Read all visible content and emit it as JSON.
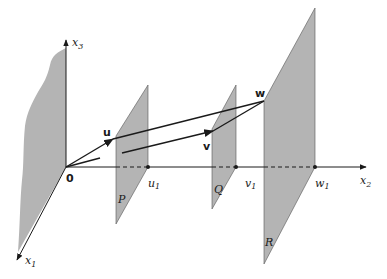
{
  "figure": {
    "axes": {
      "x1": {
        "label": "x",
        "sub": "1"
      },
      "x2": {
        "label": "x",
        "sub": "2"
      },
      "x3": {
        "label": "x",
        "sub": "3"
      }
    },
    "origin_label": "0",
    "vectors": {
      "u": "u",
      "v": "v",
      "w": "w"
    },
    "planes": {
      "P": "P",
      "Q": "Q",
      "R": "R"
    },
    "intercepts": {
      "u1": {
        "label": "u",
        "sub": "1"
      },
      "v1": {
        "label": "v",
        "sub": "1"
      },
      "w1": {
        "label": "w",
        "sub": "1"
      }
    },
    "colors": {
      "plane_fill": "#b4b4b4",
      "line": "#1a1a1a",
      "background": "#ffffff"
    }
  }
}
